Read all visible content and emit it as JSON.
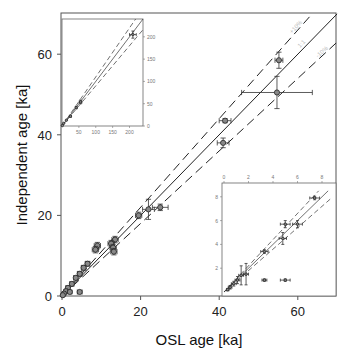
{
  "chart_data": {
    "type": "scatter",
    "title": "",
    "xlabel": "OSL age [ka]",
    "ylabel": "Independent age [ka]",
    "xlim": [
      0,
      70
    ],
    "ylim": [
      0,
      70
    ],
    "xticks": [
      0,
      20,
      40,
      60
    ],
    "yticks": [
      0,
      20,
      40,
      60
    ],
    "grid": false,
    "reference_lines": [
      {
        "name": "1:1",
        "slope": 1.0,
        "style": "solid"
      },
      {
        "name": "+10%",
        "slope": 1.1,
        "style": "dashed"
      },
      {
        "name": "-10%",
        "slope": 0.9,
        "style": "dashed"
      }
    ],
    "series": [
      {
        "name": "main",
        "points": [
          {
            "x": 55.2,
            "y": 58.5,
            "xerr": 1.0,
            "yerr": 2.0
          },
          {
            "x": 54.7,
            "y": 50.5,
            "xerr": 9.0,
            "yerr": 4.0
          },
          {
            "x": 41.5,
            "y": 43.5,
            "xerr": 1.5,
            "yerr": 0.5
          },
          {
            "x": 41.0,
            "y": 38.0,
            "xerr": 1.5,
            "yerr": 1.2
          },
          {
            "x": 25.0,
            "y": 22.0,
            "xerr": 2.0,
            "yerr": 0.8
          },
          {
            "x": 22.0,
            "y": 21.5,
            "xerr": 1.5,
            "yerr": 2.5
          },
          {
            "x": 19.5,
            "y": 20.0,
            "xerr": 0.8,
            "yerr": 0.8
          },
          {
            "x": 13.5,
            "y": 14.0,
            "xerr": 0.8,
            "yerr": 0.8
          },
          {
            "x": 12.5,
            "y": 13.0,
            "xerr": 0.8,
            "yerr": 0.8
          },
          {
            "x": 13.0,
            "y": 12.0,
            "xerr": 0.8,
            "yerr": 0.8
          },
          {
            "x": 13.2,
            "y": 11.0,
            "xerr": 0.8,
            "yerr": 0.8
          },
          {
            "x": 9.0,
            "y": 12.5,
            "xerr": 0.8,
            "yerr": 0.8
          },
          {
            "x": 8.5,
            "y": 11.5,
            "xerr": 0.8,
            "yerr": 0.8
          },
          {
            "x": 6.5,
            "y": 8.0,
            "xerr": 0.6,
            "yerr": 0.6
          },
          {
            "x": 5.5,
            "y": 7.0,
            "xerr": 0.6,
            "yerr": 0.6
          },
          {
            "x": 4.5,
            "y": 5.5,
            "xerr": 0.6,
            "yerr": 0.6
          },
          {
            "x": 3.5,
            "y": 4.5,
            "xerr": 0.5,
            "yerr": 0.5
          },
          {
            "x": 2.5,
            "y": 3.0,
            "xerr": 0.5,
            "yerr": 0.5
          },
          {
            "x": 1.5,
            "y": 2.0,
            "xerr": 0.5,
            "yerr": 0.5
          },
          {
            "x": 1.0,
            "y": 1.2,
            "xerr": 0.4,
            "yerr": 0.4
          },
          {
            "x": 0.5,
            "y": 0.6,
            "xerr": 0.3,
            "yerr": 0.3
          },
          {
            "x": 0.2,
            "y": 0.2,
            "xerr": 0.2,
            "yerr": 0.2
          },
          {
            "x": 4.5,
            "y": 1.0,
            "xerr": 0.6,
            "yerr": 0.3
          },
          {
            "x": 2.0,
            "y": 1.0,
            "xerr": 0.5,
            "yerr": 0.3
          }
        ]
      }
    ],
    "insets": [
      {
        "name": "full-range inset",
        "position": "top-left",
        "xticks": [
          50,
          100,
          150,
          200
        ],
        "yticks": [
          0,
          50,
          100,
          150,
          200
        ],
        "xlim": [
          0,
          240
        ],
        "ylim": [
          0,
          240
        ],
        "points": [
          {
            "x": 210,
            "y": 205,
            "xerr": 10,
            "yerr": 8
          },
          {
            "x": 55,
            "y": 54,
            "xerr": 4,
            "yerr": 4
          },
          {
            "x": 42,
            "y": 41,
            "xerr": 2,
            "yerr": 2
          },
          {
            "x": 25,
            "y": 22,
            "xerr": 2,
            "yerr": 2
          },
          {
            "x": 13,
            "y": 13,
            "xerr": 1,
            "yerr": 1
          },
          {
            "x": 5,
            "y": 6,
            "xerr": 1,
            "yerr": 1
          },
          {
            "x": 1,
            "y": 1,
            "xerr": 1,
            "yerr": 1
          }
        ]
      },
      {
        "name": "young-samples inset",
        "position": "bottom-right",
        "xticks": [
          0,
          2,
          4,
          6,
          8
        ],
        "yticks": [
          2,
          4,
          6,
          8
        ],
        "xlim": [
          0,
          8.8
        ],
        "ylim": [
          0,
          8.5
        ],
        "points": [
          {
            "x": 7.4,
            "y": 7.9,
            "xerr": 0.4,
            "yerr": 0.15
          },
          {
            "x": 5.0,
            "y": 5.7,
            "xerr": 0.4,
            "yerr": 0.3
          },
          {
            "x": 6.0,
            "y": 5.7,
            "xerr": 0.4,
            "yerr": 0.3
          },
          {
            "x": 4.8,
            "y": 4.5,
            "xerr": 0.3,
            "yerr": 0.5
          },
          {
            "x": 3.3,
            "y": 3.4,
            "xerr": 0.3,
            "yerr": 0.15
          },
          {
            "x": 1.8,
            "y": 1.5,
            "xerr": 0.2,
            "yerr": 0.9
          },
          {
            "x": 1.4,
            "y": 1.4,
            "xerr": 0.2,
            "yerr": 0.8
          },
          {
            "x": 1.1,
            "y": 1.0,
            "xerr": 0.2,
            "yerr": 0.3
          },
          {
            "x": 0.8,
            "y": 0.7,
            "xerr": 0.2,
            "yerr": 0.2
          },
          {
            "x": 0.5,
            "y": 0.4,
            "xerr": 0.15,
            "yerr": 0.15
          },
          {
            "x": 0.3,
            "y": 0.2,
            "xerr": 0.1,
            "yerr": 0.1
          },
          {
            "x": 3.3,
            "y": 1.0,
            "xerr": 0.2,
            "yerr": 0.1
          },
          {
            "x": 5.0,
            "y": 1.0,
            "xerr": 0.4,
            "yerr": 0.1
          }
        ]
      }
    ]
  },
  "labels": {
    "xlabel": "OSL age [ka]",
    "ylabel": "Independent age [ka]",
    "line_plus": "+10%",
    "line_one": "1:1",
    "line_minus": "-10%"
  }
}
